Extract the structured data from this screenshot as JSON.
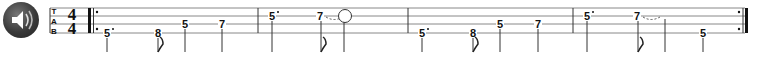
{
  "player": {
    "play_button_icon": "speaker-icon"
  },
  "clef": {
    "letters": [
      "T",
      "A",
      "B"
    ],
    "time_signature": {
      "top": "4",
      "bottom": "4"
    }
  },
  "staff": {
    "lines_y": [
      8,
      16,
      24,
      33
    ],
    "line_color": "#888888",
    "barlines_x": [
      258,
      408,
      573
    ],
    "start_repeat_x": 88,
    "end_repeat_x": 745
  },
  "measures": [
    {
      "notes": [
        {
          "fret": "5",
          "x": 107,
          "string": 4,
          "dotted": true,
          "stem_x": 107,
          "flag": false
        },
        {
          "fret": "8",
          "x": 158,
          "string": 4,
          "dotted": false,
          "stem_x": 158,
          "flag": true
        },
        {
          "fret": "5",
          "x": 185,
          "string": 3,
          "dotted": false,
          "stem_x": 185,
          "flag": false
        },
        {
          "fret": "7",
          "x": 222,
          "string": 3,
          "dotted": false,
          "stem_x": 222,
          "flag": false
        }
      ]
    },
    {
      "notes": [
        {
          "fret": "5",
          "x": 272,
          "string": 2,
          "dotted": true,
          "stem_x": 272,
          "flag": false
        },
        {
          "fret": "7",
          "x": 320,
          "string": 2,
          "dotted": false,
          "stem_x": 321,
          "flag": true,
          "tie": true
        },
        {
          "fret": "",
          "x": 345,
          "string": 2,
          "dotted": false,
          "stem_x": 344,
          "flag": false,
          "circle": true
        }
      ]
    },
    {
      "notes": [
        {
          "fret": "5",
          "x": 422,
          "string": 4,
          "dotted": true,
          "stem_x": 422,
          "flag": false
        },
        {
          "fret": "8",
          "x": 473,
          "string": 4,
          "dotted": false,
          "stem_x": 473,
          "flag": true
        },
        {
          "fret": "5",
          "x": 500,
          "string": 3,
          "dotted": false,
          "stem_x": 500,
          "flag": false
        },
        {
          "fret": "7",
          "x": 538,
          "string": 3,
          "dotted": false,
          "stem_x": 538,
          "flag": false
        }
      ]
    },
    {
      "notes": [
        {
          "fret": "5",
          "x": 587,
          "string": 2,
          "dotted": true,
          "stem_x": 587,
          "flag": false
        },
        {
          "fret": "7",
          "x": 637,
          "string": 2,
          "dotted": false,
          "stem_x": 638,
          "flag": true,
          "tie": true
        },
        {
          "fret": "",
          "x": 665,
          "string": 2,
          "dotted": false,
          "stem_x": 665,
          "flag": false,
          "hidden": true
        },
        {
          "fret": "5",
          "x": 703,
          "string": 4,
          "dotted": false,
          "stem_x": 703,
          "flag": false
        }
      ]
    }
  ]
}
